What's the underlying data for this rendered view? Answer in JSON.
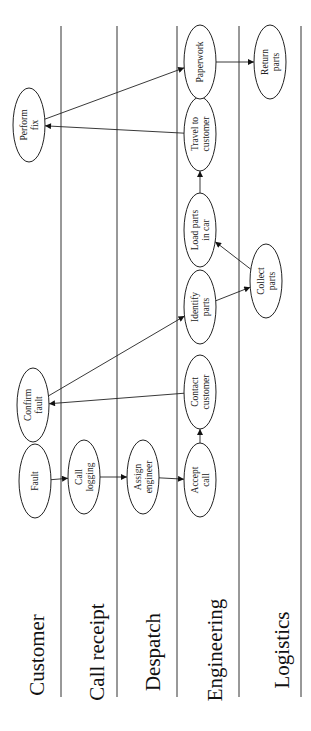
{
  "diagram": {
    "type": "swimlane-process",
    "orientation": "rotated-90-ccw",
    "colors": {
      "line": "#333333",
      "text": "#222222",
      "background": "#ffffff"
    },
    "lanes": [
      {
        "id": "customer",
        "label": "Customer",
        "line_x": 61,
        "label_x": 37,
        "label_y": 655
      },
      {
        "id": "call_receipt",
        "label": "Call receipt",
        "line_x": 117,
        "label_x": 97,
        "label_y": 652
      },
      {
        "id": "despatch",
        "label": "Despatch",
        "line_x": 177,
        "label_x": 153,
        "label_y": 652
      },
      {
        "id": "engineering",
        "label": "Engineering",
        "line_x": 239,
        "label_x": 215,
        "label_y": 650
      },
      {
        "id": "logistics",
        "label": "Logistics",
        "line_x": 301,
        "label_x": 282,
        "label_y": 650
      }
    ],
    "nodes": [
      {
        "id": "fault",
        "lane": "customer",
        "lines": [
          "Fault"
        ],
        "cx": 35,
        "cy": 481
      },
      {
        "id": "call_logging",
        "lane": "call_receipt",
        "lines": [
          "Call",
          "logging"
        ],
        "cx": 84,
        "cy": 477
      },
      {
        "id": "assign_engineer",
        "lane": "despatch",
        "lines": [
          "Assign",
          "engineer"
        ],
        "cx": 143,
        "cy": 477
      },
      {
        "id": "accept_call",
        "lane": "engineering",
        "lines": [
          "Accept",
          "call"
        ],
        "cx": 200,
        "cy": 480
      },
      {
        "id": "confirm_fault",
        "lane": "customer",
        "lines": [
          "Confirm",
          "fault"
        ],
        "cx": 33,
        "cy": 405
      },
      {
        "id": "contact_customer",
        "lane": "engineering",
        "lines": [
          "Contact",
          "customer"
        ],
        "cx": 200,
        "cy": 392
      },
      {
        "id": "identify_parts",
        "lane": "engineering",
        "lines": [
          "Identify",
          "parts"
        ],
        "cx": 200,
        "cy": 307
      },
      {
        "id": "collect_parts",
        "lane": "logistics",
        "lines": [
          "Collect",
          "parts"
        ],
        "cx": 266,
        "cy": 281
      },
      {
        "id": "load_parts",
        "lane": "engineering",
        "lines": [
          "Load parts",
          "in car"
        ],
        "cx": 200,
        "cy": 230
      },
      {
        "id": "travel_to_customer",
        "lane": "engineering",
        "lines": [
          "Travel to",
          "customer"
        ],
        "cx": 200,
        "cy": 134
      },
      {
        "id": "perform_fix",
        "lane": "customer",
        "lines": [
          "Perform",
          "fix"
        ],
        "cx": 29,
        "cy": 125
      },
      {
        "id": "paperwork",
        "lane": "engineering",
        "lines": [
          "Paperwork"
        ],
        "cx": 200,
        "cy": 62
      },
      {
        "id": "return_parts",
        "lane": "logistics",
        "lines": [
          "Return",
          "parts"
        ],
        "cx": 270,
        "cy": 62
      }
    ],
    "edges": [
      {
        "from": "fault",
        "to": "call_logging"
      },
      {
        "from": "call_logging",
        "to": "assign_engineer"
      },
      {
        "from": "assign_engineer",
        "to": "accept_call"
      },
      {
        "from": "accept_call",
        "to": "contact_customer"
      },
      {
        "from": "contact_customer",
        "to": "confirm_fault"
      },
      {
        "from": "confirm_fault",
        "to": "identify_parts"
      },
      {
        "from": "identify_parts",
        "to": "collect_parts"
      },
      {
        "from": "collect_parts",
        "to": "load_parts"
      },
      {
        "from": "load_parts",
        "to": "travel_to_customer"
      },
      {
        "from": "travel_to_customer",
        "to": "perform_fix"
      },
      {
        "from": "perform_fix",
        "to": "paperwork"
      },
      {
        "from": "paperwork",
        "to": "return_parts"
      }
    ]
  }
}
